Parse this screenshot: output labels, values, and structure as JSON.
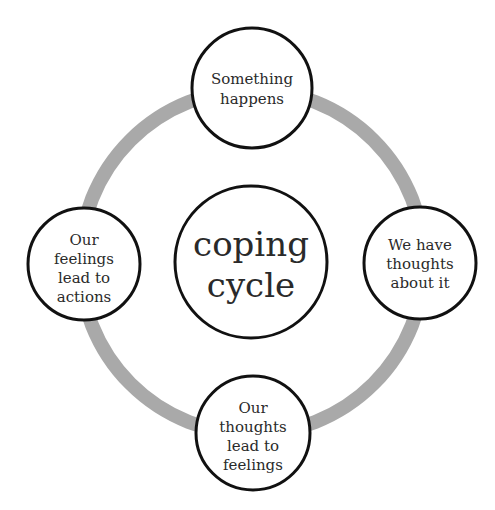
{
  "diagram": {
    "title": "coping cycle",
    "center": {
      "lines": [
        "coping",
        "cycle"
      ]
    },
    "nodes": [
      {
        "id": "top",
        "lines": [
          "Something",
          "happens"
        ]
      },
      {
        "id": "right",
        "lines": [
          "We have",
          "thoughts",
          "about it"
        ]
      },
      {
        "id": "bottom",
        "lines": [
          "Our",
          "thoughts",
          "lead to",
          "feelings"
        ]
      },
      {
        "id": "left",
        "lines": [
          "Our",
          "feelings",
          "lead to",
          "actions"
        ]
      }
    ],
    "colors": {
      "ring": "#a9a9a9",
      "circle_stroke": "#111111",
      "circle_fill": "#ffffff",
      "text": "#2a2a2a"
    }
  }
}
